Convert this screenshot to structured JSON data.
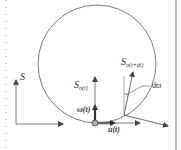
{
  "figure": {
    "labels": {
      "world_frame": "S",
      "body_frame_main": "S",
      "body_frame_sub": "o(t)",
      "next_frame_main": "S",
      "next_frame_sub": "o(t+dt)",
      "angular_velocity": "ω(t)",
      "linear_velocity": "u(t)",
      "rotation_increment": "dϖ"
    },
    "colors": {
      "line": "#555555",
      "thick_arrow": "#333333",
      "point_fill": "#b0b0b0",
      "border": "#777777"
    }
  }
}
